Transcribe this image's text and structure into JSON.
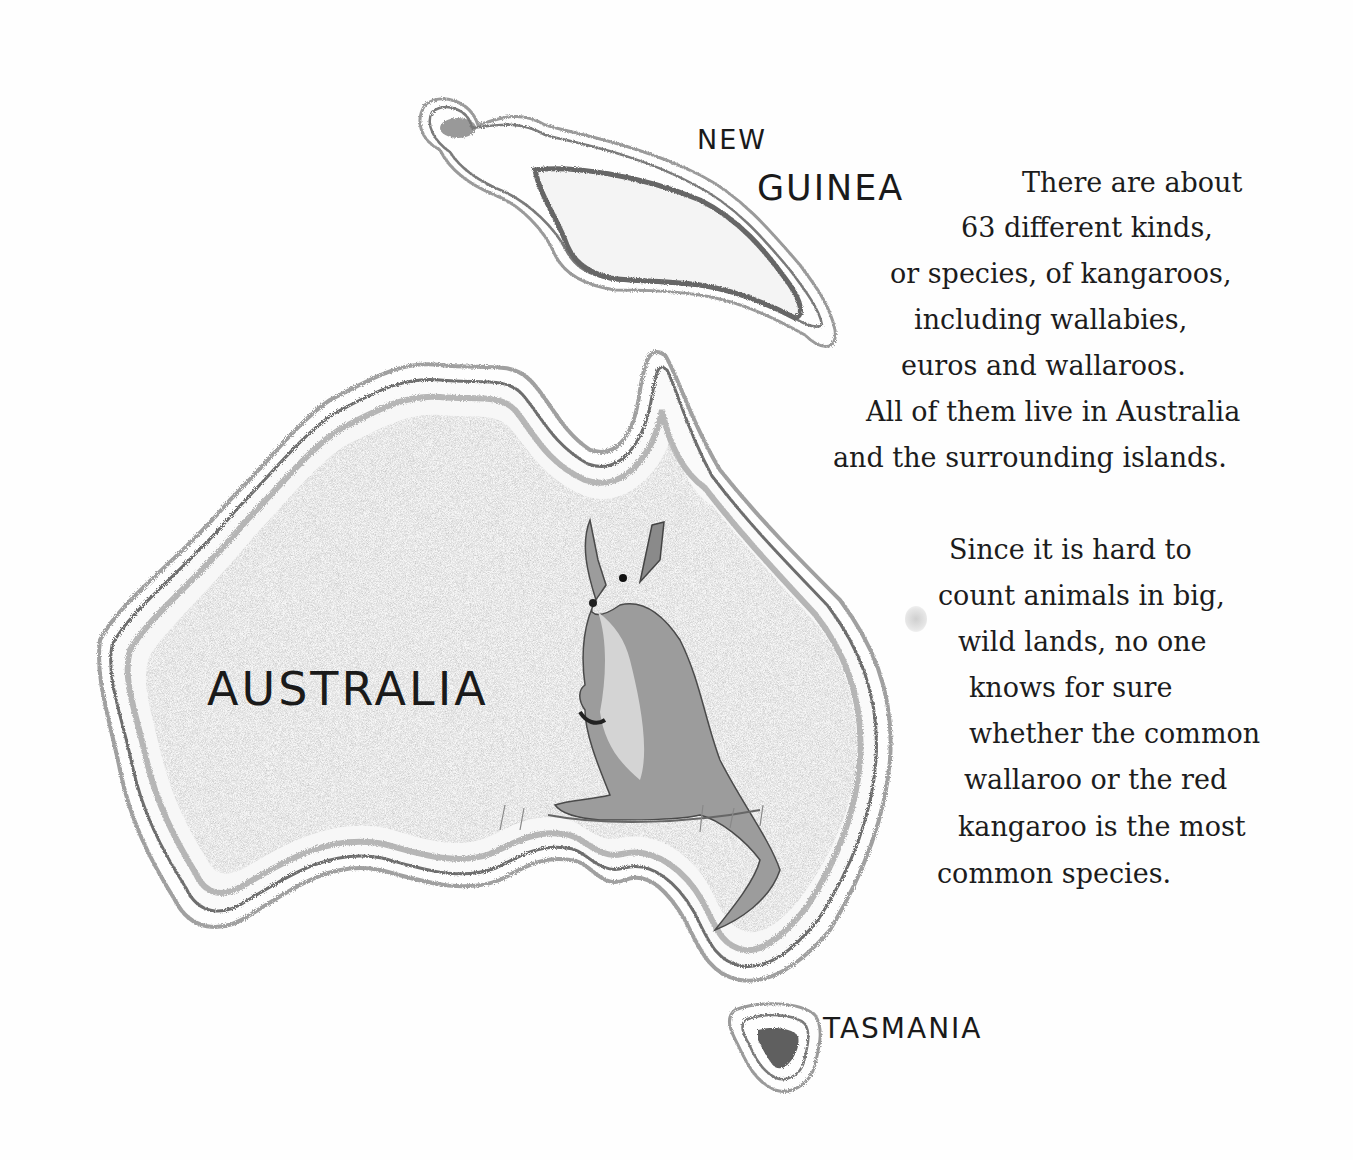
{
  "map": {
    "labels": {
      "new_guinea_line1": "NEW",
      "new_guinea_line2": "GUINEA",
      "australia": "AUSTRALIA",
      "tasmania": "TASMANIA"
    },
    "illustration": "kangaroo"
  },
  "text": {
    "paragraph1": {
      "lines": [
        "There are about",
        "63 different kinds,",
        "or species, of kangaroos,",
        "including wallabies,",
        "euros and wallaroos.",
        "All of them live in Australia",
        "and the surrounding islands."
      ]
    },
    "paragraph2": {
      "lines": [
        "Since it is hard to",
        "count animals in big,",
        "wild lands, no one",
        "knows for sure",
        "whether the common",
        "wallaroo or the red",
        "kangaroo is the most",
        "common species."
      ]
    }
  },
  "colors": {
    "ink": "#1c1c1c",
    "pencil": "#8a8a8a",
    "paper": "#fefefe"
  }
}
